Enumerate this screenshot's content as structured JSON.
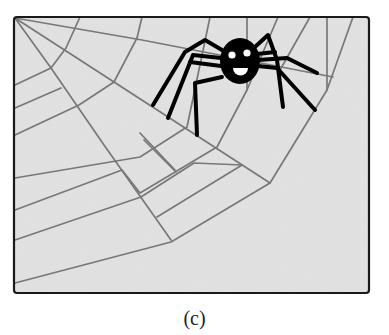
{
  "figure": {
    "caption": "(c)",
    "colors": {
      "page_background": "#ffffff",
      "panel_background": "#e2e2e2",
      "panel_border": "#1a1a1a",
      "web_line": "#787878",
      "spider_body": "#000000",
      "spider_face": "#ffffff"
    },
    "frame": {
      "x": 14,
      "y": 17,
      "width": 355,
      "height": 276,
      "corner_radius": 3
    },
    "web": {
      "anchor": [
        15,
        18
      ],
      "radials": [
        [
          [
            15,
            18
          ],
          [
            142,
            40
          ],
          [
            333,
            77
          ]
        ],
        [
          [
            15,
            18
          ],
          [
            114,
            82
          ],
          [
            270,
            183
          ]
        ],
        [
          [
            15,
            18
          ],
          [
            51,
            68
          ],
          [
            104,
            145
          ],
          [
            171,
            240
          ]
        ]
      ],
      "rings": [
        [
          [
            80,
            17
          ],
          [
            66,
            48
          ],
          [
            51,
            68
          ],
          [
            15,
            85
          ]
        ],
        [
          [
            142,
            17
          ],
          [
            137,
            38
          ],
          [
            114,
            82
          ],
          [
            79,
            105
          ],
          [
            15,
            135
          ]
        ],
        [
          [
            15,
            108
          ],
          [
            61,
            88
          ]
        ],
        [
          [
            210,
            17
          ],
          [
            187,
            127
          ],
          [
            140,
            157
          ],
          [
            15,
            178
          ]
        ],
        [
          [
            247,
            17
          ],
          [
            247,
            90
          ],
          [
            217,
            147
          ],
          [
            140,
            193
          ],
          [
            122,
            170
          ],
          [
            15,
            210
          ]
        ],
        [
          [
            15,
            240
          ],
          [
            141,
            197
          ],
          [
            194,
            163
          ],
          [
            242,
            165
          ],
          [
            157,
            217
          ]
        ],
        [
          [
            327,
            17
          ],
          [
            327,
            90
          ],
          [
            270,
            183
          ],
          [
            171,
            242
          ],
          [
            15,
            283
          ]
        ],
        [
          [
            353,
            17
          ],
          [
            327,
            90
          ]
        ],
        [
          [
            278,
            17
          ],
          [
            247,
            90
          ]
        ],
        [
          [
            310,
            17
          ],
          [
            280,
            70
          ]
        ]
      ],
      "spokes": [
        [
          [
            144,
            140
          ],
          [
            176,
            172
          ]
        ],
        [
          [
            140,
            133
          ],
          [
            175,
            170
          ]
        ]
      ]
    },
    "spider": {
      "body": {
        "cx": 240,
        "cy": 61,
        "rx": 20,
        "ry": 23
      },
      "eyes": [
        {
          "cx": 232,
          "cy": 55,
          "r": 3.6
        },
        {
          "cx": 247,
          "cy": 53,
          "r": 3.6
        }
      ],
      "smile": {
        "x1": 233,
        "y1": 68,
        "x2": 248,
        "y2": 68
      },
      "legs": [
        [
          [
            222,
            50
          ],
          [
            205,
            40
          ],
          [
            185,
            52
          ],
          [
            153,
            105
          ]
        ],
        [
          [
            221,
            58
          ],
          [
            193,
            55
          ],
          [
            168,
            118
          ]
        ],
        [
          [
            221,
            66
          ],
          [
            190,
            62
          ]
        ],
        [
          [
            222,
            77
          ],
          [
            195,
            83
          ],
          [
            197,
            135
          ]
        ],
        [
          [
            256,
            46
          ],
          [
            268,
            35
          ],
          [
            277,
            60
          ],
          [
            283,
            107
          ]
        ],
        [
          [
            258,
            60
          ],
          [
            287,
            58
          ],
          [
            317,
            73
          ]
        ],
        [
          [
            258,
            66
          ],
          [
            277,
            68
          ],
          [
            315,
            110
          ]
        ],
        [
          [
            257,
            54
          ],
          [
            275,
            52
          ]
        ]
      ]
    }
  }
}
